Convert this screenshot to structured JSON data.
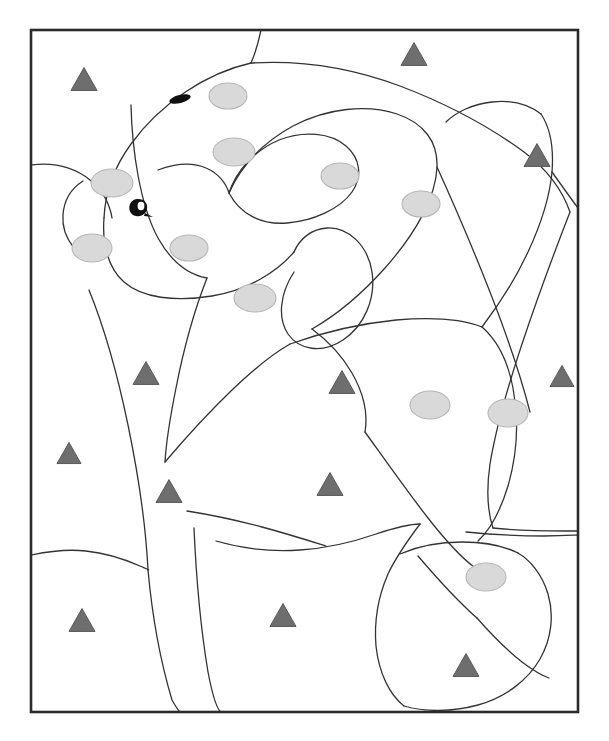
{
  "figure": {
    "domain_label": "micrograph-region-tracing",
    "caption_visible": false,
    "panel_label_cropped": true,
    "background_color": "#ffffff",
    "canvas": {
      "width": 609,
      "height": 741
    }
  },
  "frame": {
    "label": "image-frame",
    "x": 31,
    "y": 30,
    "width": 547,
    "height": 682,
    "stroke_color": "#2b2b2b",
    "stroke_width": 2.6,
    "fill": "none"
  },
  "cropped_top_elements": [
    {
      "name": "cropped-panel-label-bar",
      "x": 345,
      "y": 0,
      "width": 33,
      "height": 3,
      "color": "#4a4a4a"
    },
    {
      "name": "cropped-faint-mark-left",
      "x": 186,
      "y": 2,
      "width": 25,
      "height": 2,
      "color": "#f1f1f1"
    },
    {
      "name": "cropped-faint-mark-right",
      "x": 344,
      "y": 6,
      "width": 32,
      "height": 2,
      "color": "#f4f4f4"
    }
  ],
  "legend_semantics": {
    "triangle_marker": "gray-triangle-marker",
    "ellipse_marker": "light-gray-nucleus-ellipse",
    "dark_marker": "dark-stained-marker",
    "boundary": "traced-region-boundary"
  },
  "style": {
    "boundary_stroke": "#333333",
    "boundary_width": 1.3,
    "triangle_fill": "#6e6e6e",
    "triangle_stroke": "#5a5a5a",
    "ellipse_fill": "#d9d9d9",
    "ellipse_stroke": "#b6b6b6",
    "dark_fill": "#111111"
  },
  "counts": {
    "triangles": 11,
    "ellipses": 11,
    "dark_markers": 2,
    "boundary_paths": 22
  },
  "triangles": [
    {
      "id": "tri-1",
      "cx": 84,
      "cy": 79,
      "size": 26
    },
    {
      "id": "tri-2",
      "cx": 414,
      "cy": 54,
      "size": 26
    },
    {
      "id": "tri-3",
      "cx": 537,
      "cy": 155,
      "size": 26
    },
    {
      "id": "tri-4",
      "cx": 146,
      "cy": 373,
      "size": 26
    },
    {
      "id": "tri-5",
      "cx": 342,
      "cy": 382,
      "size": 26
    },
    {
      "id": "tri-6",
      "cx": 562,
      "cy": 376,
      "size": 24
    },
    {
      "id": "tri-7",
      "cx": 69,
      "cy": 453,
      "size": 24
    },
    {
      "id": "tri-8",
      "cx": 169,
      "cy": 491,
      "size": 26
    },
    {
      "id": "tri-9",
      "cx": 330,
      "cy": 484,
      "size": 26
    },
    {
      "id": "tri-10",
      "cx": 82,
      "cy": 620,
      "size": 26
    },
    {
      "id": "tri-11",
      "cx": 283,
      "cy": 615,
      "size": 26
    },
    {
      "id": "tri-12",
      "cx": 466,
      "cy": 665,
      "size": 26
    }
  ],
  "ellipses": [
    {
      "id": "ell-1",
      "cx": 228,
      "cy": 96,
      "rx": 19,
      "ry": 13
    },
    {
      "id": "ell-2",
      "cx": 234,
      "cy": 152,
      "rx": 21,
      "ry": 14
    },
    {
      "id": "ell-3",
      "cx": 340,
      "cy": 176,
      "rx": 19,
      "ry": 13
    },
    {
      "id": "ell-4",
      "cx": 112,
      "cy": 183,
      "rx": 21,
      "ry": 14
    },
    {
      "id": "ell-5",
      "cx": 421,
      "cy": 204,
      "rx": 19,
      "ry": 13
    },
    {
      "id": "ell-6",
      "cx": 92,
      "cy": 248,
      "rx": 20,
      "ry": 14
    },
    {
      "id": "ell-7",
      "cx": 189,
      "cy": 248,
      "rx": 19,
      "ry": 13
    },
    {
      "id": "ell-8",
      "cx": 255,
      "cy": 298,
      "rx": 21,
      "ry": 14
    },
    {
      "id": "ell-9",
      "cx": 430,
      "cy": 405,
      "rx": 20,
      "ry": 14
    },
    {
      "id": "ell-10",
      "cx": 508,
      "cy": 413,
      "rx": 20,
      "ry": 14
    },
    {
      "id": "ell-11",
      "cx": 486,
      "cy": 577,
      "rx": 20,
      "ry": 14
    }
  ],
  "dark_markers": [
    {
      "id": "dark-1",
      "type": "tilted-ellipse",
      "cx": 180,
      "cy": 99,
      "rx": 11,
      "ry": 4,
      "rotation": -14
    },
    {
      "id": "dark-2",
      "type": "comma-blob",
      "cx": 139,
      "cy": 207
    }
  ],
  "boundaries": [
    {
      "id": "b-1",
      "d": "M 261 30 C 258 44 255 54 251 63"
    },
    {
      "id": "b-2",
      "d": "M 251 63 C 206 73 160 104 131 144 C 112 170 105 196 104 218"
    },
    {
      "id": "b-3",
      "d": "M 251 63 C 300 60 352 68 400 86 C 450 105 494 130 524 152 C 548 170 563 192 570 212"
    },
    {
      "id": "b-4",
      "d": "M 31 165 C 55 162 75 168 90 180 C 103 190 110 205 112 218"
    },
    {
      "id": "b-5",
      "d": "M 104 218 C 102 244 108 268 124 282 C 142 298 175 302 212 296 C 248 290 277 272 294 252"
    },
    {
      "id": "b-6",
      "d": "M 131 105 C 132 150 140 205 158 238 C 172 263 190 275 207 278"
    },
    {
      "id": "b-7",
      "d": "M 158 170 C 174 164 192 162 206 168 C 218 173 226 183 229 193"
    },
    {
      "id": "b-8",
      "d": "M 229 193 C 236 172 253 151 279 140 C 304 130 331 133 346 146 C 360 158 363 176 352 192 C 340 209 313 221 287 223 C 261 225 240 214 229 193 Z"
    },
    {
      "id": "b-9",
      "d": "M 229 193 C 241 166 262 143 293 126 C 327 108 367 104 397 114 C 424 123 438 142 437 167 C 436 197 416 233 385 268 C 360 296 333 317 312 329"
    },
    {
      "id": "b-10",
      "d": "M 294 252 C 300 238 312 229 327 228 C 349 227 368 246 372 272 C 376 299 364 326 343 340 C 322 354 299 350 288 334 C 278 319 279 295 294 272"
    },
    {
      "id": "b-11",
      "d": "M 312 329 C 327 340 342 356 352 373 C 364 394 368 414 365 432"
    },
    {
      "id": "b-12",
      "d": "M 89 290 C 102 322 117 372 128 425 C 139 478 146 530 148 570"
    },
    {
      "id": "b-13",
      "d": "M 148 570 C 152 614 160 660 172 700 C 176 707 178 710 180 712"
    },
    {
      "id": "b-14",
      "d": "M 207 278 C 196 306 184 347 176 388 C 170 418 166 444 165 462"
    },
    {
      "id": "b-15",
      "d": "M 165 462 C 182 442 206 415 232 390 C 256 367 276 352 290 344"
    },
    {
      "id": "b-16",
      "d": "M 290 344 C 318 334 356 324 396 320 C 432 317 462 319 482 327"
    },
    {
      "id": "b-17",
      "d": "M 482 327 C 497 340 508 362 513 388 C 519 420 517 455 508 486 C 500 512 489 531 478 541"
    },
    {
      "id": "b-18",
      "d": "M 365 432 C 383 457 406 490 428 518 C 446 541 462 558 474 567"
    },
    {
      "id": "b-19",
      "d": "M 437 167 C 452 200 472 246 490 292 C 508 338 522 381 530 412"
    },
    {
      "id": "b-20",
      "d": "M 570 212 C 556 248 538 296 522 344 C 506 392 495 434 490 464 C 486 492 488 513 493 528"
    },
    {
      "id": "b-21",
      "d": "M 493 528 C 512 530 540 531 566 531 C 573 531 577 531 578 531"
    },
    {
      "id": "b-22",
      "d": "M 187 511 C 206 514 232 519 262 527 C 288 534 310 541 326 546"
    },
    {
      "id": "b-23",
      "d": "M 194 528 C 196 574 201 630 208 672 C 213 698 218 710 221 712"
    },
    {
      "id": "b-24",
      "d": "M 216 541 C 240 548 270 552 300 550 C 330 548 356 541 376 534 C 394 528 408 524 420 524"
    },
    {
      "id": "b-25",
      "d": "M 420 524 C 408 540 396 557 388 574 C 378 597 374 622 376 646 C 379 674 390 695 404 706"
    },
    {
      "id": "b-26",
      "d": "M 404 706 C 424 712 452 712 478 705 C 506 697 528 680 540 659 C 552 638 554 614 548 594 C 542 574 530 560 518 553"
    },
    {
      "id": "b-27",
      "d": "M 518 553 C 504 546 484 542 462 542 C 438 542 416 547 400 554"
    },
    {
      "id": "b-28",
      "d": "M 418 556 C 430 570 444 586 458 600 C 466 608 472 614 477 618"
    },
    {
      "id": "b-29",
      "d": "M 477 618 C 491 634 508 651 522 662 C 534 671 543 676 549 678"
    },
    {
      "id": "b-30",
      "d": "M 31 555 C 50 551 68 549 86 551 C 106 553 124 559 140 566 C 147 569 150 570 148 570"
    },
    {
      "id": "b-31",
      "d": "M 466 532 C 486 534 516 536 544 536 C 564 536 575 535 578 535"
    },
    {
      "id": "b-32",
      "d": "M 482 327 C 498 306 515 280 528 252 C 542 222 550 194 552 172 C 554 146 549 126 541 114"
    },
    {
      "id": "b-33",
      "d": "M 541 114 C 528 104 510 100 492 102 C 473 104 456 112 446 122"
    },
    {
      "id": "b-34",
      "d": "M 552 172 C 562 186 572 200 578 208"
    },
    {
      "id": "b-35",
      "d": "M 74 248 C 66 238 62 226 63 215 C 64 200 72 188 83 181"
    }
  ]
}
